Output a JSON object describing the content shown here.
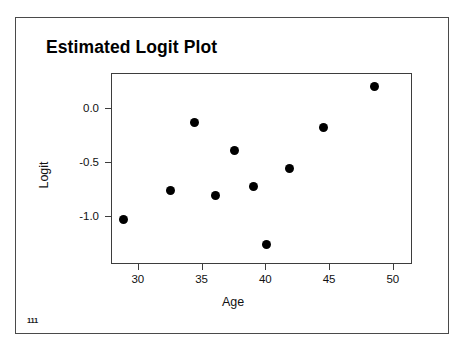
{
  "slide": {
    "title": "Estimated Logit Plot",
    "page_number": "111",
    "border_color": "#4a4a4a",
    "background": "#ffffff"
  },
  "chart_data": {
    "type": "scatter",
    "title": "Estimated Logit Plot",
    "xlabel": "Age",
    "ylabel": "Logit",
    "xlim": [
      27.9,
      51.5
    ],
    "ylim": [
      -1.45,
      0.33
    ],
    "xticks": [
      30,
      35,
      40,
      45,
      50
    ],
    "xtick_labels": [
      "30",
      "35",
      "40",
      "45",
      "50"
    ],
    "yticks": [
      0.0,
      -0.5,
      -1.0
    ],
    "ytick_labels": [
      "0.0",
      "-0.5",
      "-1.0"
    ],
    "grid": false,
    "legend": null,
    "marker": {
      "shape": "circle",
      "color": "#000000",
      "size_px": 9
    },
    "points": [
      {
        "x": 28.8,
        "y": -1.03
      },
      {
        "x": 32.5,
        "y": -0.76
      },
      {
        "x": 34.4,
        "y": -0.12
      },
      {
        "x": 36.0,
        "y": -0.8
      },
      {
        "x": 37.5,
        "y": -0.38
      },
      {
        "x": 39.0,
        "y": -0.72
      },
      {
        "x": 40.0,
        "y": -1.26
      },
      {
        "x": 41.8,
        "y": -0.55
      },
      {
        "x": 44.5,
        "y": -0.17
      },
      {
        "x": 48.5,
        "y": 0.21
      }
    ]
  }
}
